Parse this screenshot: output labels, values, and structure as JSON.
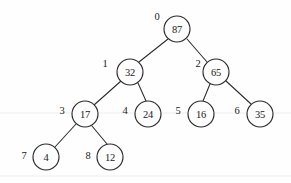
{
  "figure": {
    "type": "binary-tree-diagram",
    "background_color": "#fefefe",
    "stroke_color": "#2b2b2b",
    "text_color": "#1a1a1a",
    "width": 291,
    "height": 183
  },
  "chart_data": {
    "type": "tree",
    "title": "",
    "node_radius": 13,
    "nodes": [
      {
        "id": "n0",
        "index_label": "0",
        "value": "87",
        "cx": 177,
        "cy": 29,
        "label_x": 157,
        "label_y": 16,
        "depth": 0
      },
      {
        "id": "n1",
        "index_label": "1",
        "value": "32",
        "cx": 130,
        "cy": 72,
        "label_x": 105,
        "label_y": 63,
        "depth": 1
      },
      {
        "id": "n2",
        "index_label": "2",
        "value": "65",
        "cx": 216,
        "cy": 72,
        "label_x": 198,
        "label_y": 63,
        "depth": 1
      },
      {
        "id": "n3",
        "index_label": "3",
        "value": "17",
        "cx": 85,
        "cy": 114,
        "label_x": 62,
        "label_y": 110,
        "depth": 2
      },
      {
        "id": "n4",
        "index_label": "4",
        "value": "24",
        "cx": 148,
        "cy": 114,
        "label_x": 125,
        "label_y": 110,
        "depth": 2
      },
      {
        "id": "n5",
        "index_label": "5",
        "value": "16",
        "cx": 201,
        "cy": 114,
        "label_x": 178,
        "label_y": 110,
        "depth": 2
      },
      {
        "id": "n6",
        "index_label": "6",
        "value": "35",
        "cx": 260,
        "cy": 114,
        "label_x": 237,
        "label_y": 110,
        "depth": 2
      },
      {
        "id": "n7",
        "index_label": "7",
        "value": "4",
        "cx": 46,
        "cy": 157,
        "label_x": 24,
        "label_y": 155,
        "depth": 3
      },
      {
        "id": "n8",
        "index_label": "8",
        "value": "12",
        "cx": 110,
        "cy": 157,
        "label_x": 88,
        "label_y": 155,
        "depth": 3
      }
    ],
    "edges": [
      {
        "from": "n0",
        "to": "n1",
        "x1": 168,
        "y1": 39,
        "x2": 139,
        "y2": 62
      },
      {
        "from": "n0",
        "to": "n2",
        "x1": 187,
        "y1": 39,
        "x2": 207,
        "y2": 62
      },
      {
        "from": "n1",
        "to": "n3",
        "x1": 121,
        "y1": 81,
        "x2": 94,
        "y2": 105
      },
      {
        "from": "n1",
        "to": "n4",
        "x1": 138,
        "y1": 83,
        "x2": 146,
        "y2": 101
      },
      {
        "from": "n2",
        "to": "n5",
        "x1": 210,
        "y1": 84,
        "x2": 203,
        "y2": 101
      },
      {
        "from": "n2",
        "to": "n6",
        "x1": 226,
        "y1": 81,
        "x2": 251,
        "y2": 104
      },
      {
        "from": "n3",
        "to": "n7",
        "x1": 76,
        "y1": 124,
        "x2": 55,
        "y2": 147
      },
      {
        "from": "n3",
        "to": "n8",
        "x1": 92,
        "y1": 126,
        "x2": 107,
        "y2": 144
      }
    ],
    "index_labels": [
      "0",
      "1",
      "2",
      "3",
      "4",
      "5",
      "6",
      "7",
      "8"
    ],
    "values": [
      "87",
      "32",
      "65",
      "17",
      "24",
      "16",
      "35",
      "4",
      "12"
    ]
  }
}
